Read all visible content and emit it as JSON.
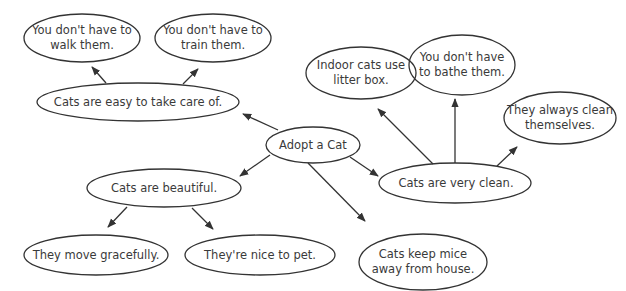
{
  "diagram": {
    "type": "concept-map",
    "central": "Adopt a Cat",
    "nodes": {
      "center": {
        "label": "Adopt a Cat"
      },
      "easy": {
        "label": "Cats are easy to take care of."
      },
      "walk": {
        "label": "You don't have to\nwalk them."
      },
      "train": {
        "label": "You don't have to\ntrain them."
      },
      "clean": {
        "label": "Cats are very clean."
      },
      "litter": {
        "label": "Indoor cats use\nlitter box."
      },
      "bathe": {
        "label": "You don't have\nto bathe them."
      },
      "selfclean": {
        "label": "They always clean\nthemselves."
      },
      "beautiful": {
        "label": "Cats are beautiful."
      },
      "graceful": {
        "label": "They move gracefully."
      },
      "pet": {
        "label": "They're nice to pet."
      },
      "mice": {
        "label": "Cats keep mice\naway from house."
      }
    },
    "edges": [
      {
        "from": "center",
        "to": "easy"
      },
      {
        "from": "center",
        "to": "beautiful"
      },
      {
        "from": "center",
        "to": "clean"
      },
      {
        "from": "center",
        "to": "mice"
      },
      {
        "from": "easy",
        "to": "walk"
      },
      {
        "from": "easy",
        "to": "train"
      },
      {
        "from": "clean",
        "to": "litter"
      },
      {
        "from": "clean",
        "to": "bathe"
      },
      {
        "from": "clean",
        "to": "selfclean"
      },
      {
        "from": "beautiful",
        "to": "graceful"
      },
      {
        "from": "beautiful",
        "to": "pet"
      }
    ],
    "colors": {
      "stroke": "#333333",
      "text": "#3a3a3a",
      "background": "#ffffff"
    }
  }
}
